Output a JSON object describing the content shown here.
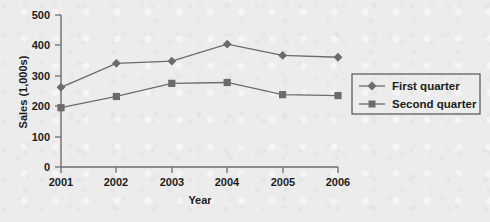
{
  "chart_data": {
    "type": "line",
    "title": "",
    "xlabel": "Year",
    "ylabel": "Sales (1,000s)",
    "categories": [
      "2001",
      "2002",
      "2003",
      "2004",
      "2005",
      "2006"
    ],
    "x_tick_labels": [
      "2001",
      "2002",
      "2003",
      "2004",
      "2005",
      "2006"
    ],
    "y_tick_labels": [
      "0",
      "100",
      "200",
      "300",
      "400",
      "500"
    ],
    "y_ticks": [
      0,
      100,
      200,
      300,
      400,
      500
    ],
    "ylim": [
      0,
      500
    ],
    "grid": false,
    "legend_position": "right-middle",
    "series": [
      {
        "name": "First quarter",
        "marker": "diamond",
        "color": "#6b6b6b",
        "values": [
          262,
          341,
          348,
          404,
          367,
          361
        ]
      },
      {
        "name": "Second quarter",
        "marker": "square",
        "color": "#6b6b6b",
        "values": [
          195,
          232,
          275,
          278,
          238,
          235
        ]
      }
    ]
  },
  "axes": {
    "y_axis_title": "Sales (1,000s)",
    "x_axis_title": "Year"
  },
  "legend": {
    "entries": [
      {
        "label": "First quarter",
        "marker": "diamond-marker"
      },
      {
        "label": "Second quarter",
        "marker": "square-marker"
      }
    ]
  },
  "colors": {
    "background": "#ececec",
    "axis": "#6e6e6e",
    "series": "#6b6b6b",
    "text": "#1c1c1c",
    "legend_border": "#5f5f5f"
  }
}
